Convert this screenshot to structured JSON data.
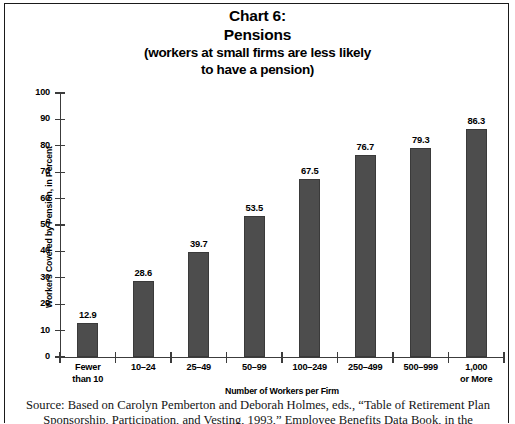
{
  "title": {
    "line1": "Chart 6:",
    "line2": "Pensions",
    "line3": "(workers at small firms are less likely",
    "line4": "to have a pension)"
  },
  "source": {
    "line1": "Source: Based on Carolyn Pemberton and Deborah Holmes, eds., “Table of Retirement Plan",
    "line2": "Sponsorship, Participation, and Vesting, 1993,” Employee Benefits Data Book, in the"
  },
  "chart_data": {
    "type": "bar",
    "title": "Chart 6: Pensions (workers at small firms are less likely to have a pension)",
    "xlabel": "Number of Workers per Firm",
    "ylabel": "Workers Covered by Pension, in Percent",
    "ylim": [
      0,
      100
    ],
    "ytick_step": 10,
    "yticks": [
      "100",
      "90",
      "80",
      "70",
      "60",
      "50",
      "40",
      "30",
      "20",
      "10",
      "0"
    ],
    "grid": false,
    "legend": "none",
    "bar_color": "#4d4d4d",
    "categories": [
      "Fewer than 10",
      "10–24",
      "25–49",
      "50–99",
      "100–249",
      "250–499",
      "500–999",
      "1,000 or More"
    ],
    "category_lines": [
      [
        "Fewer",
        "than 10"
      ],
      [
        "10–24",
        ""
      ],
      [
        "25–49",
        ""
      ],
      [
        "50–99",
        ""
      ],
      [
        "100–249",
        ""
      ],
      [
        "250–499",
        ""
      ],
      [
        "500–999",
        ""
      ],
      [
        "1,000",
        "or More"
      ]
    ],
    "values": [
      12.9,
      28.6,
      39.7,
      53.5,
      67.5,
      76.7,
      79.3,
      86.3
    ],
    "value_labels": [
      "12.9",
      "28.6",
      "39.7",
      "53.5",
      "67.5",
      "76.7",
      "79.3",
      "86.3"
    ]
  }
}
